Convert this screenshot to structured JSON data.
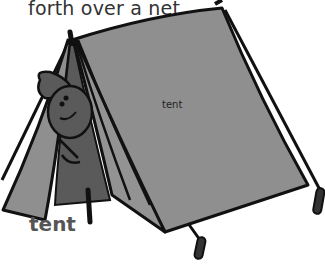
{
  "text": {
    "top_fragment": "forth over a net.",
    "headword": "tent",
    "illustration_label": "tent"
  },
  "illustration": {
    "subject": "tent-with-child-peeking",
    "colors": {
      "fabric": "#8f8f8f",
      "fabric_dark": "#5a5a5a",
      "outline": "#111111",
      "background": "#ffffff"
    }
  }
}
